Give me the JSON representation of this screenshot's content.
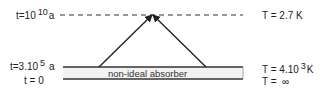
{
  "diagram": {
    "left_labels": {
      "top": {
        "prefix": "t=10",
        "exp": "10",
        "unit": "a"
      },
      "middle": {
        "prefix": "t=3.10",
        "exp": "5",
        "unit": "a"
      },
      "bottom": {
        "text": "t = 0"
      }
    },
    "right_labels": {
      "top": {
        "text": "T = 2.7 K"
      },
      "middle": {
        "prefix": "T = 4.10",
        "exp": "3",
        "unit": "K"
      },
      "bottom": {
        "text": "T =  ∞"
      }
    },
    "absorber_label": "non-ideal  absorber",
    "colors": {
      "line": "#333333",
      "absorber_fill": "#f2f2f2",
      "text": "#222222"
    }
  }
}
